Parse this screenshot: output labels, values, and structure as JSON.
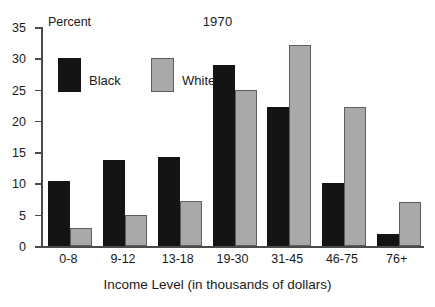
{
  "chart_data": {
    "type": "bar",
    "title": "1970",
    "xlabel": "Income Level (in thousands of dollars)",
    "ylabel": "Percent",
    "ylim": [
      0,
      35
    ],
    "yticks": [
      0,
      5,
      10,
      15,
      20,
      25,
      30,
      35
    ],
    "grid": false,
    "legend_position": "upper-left-inside",
    "categories": [
      "0-8",
      "9-12",
      "13-18",
      "19-30",
      "31-45",
      "46-75",
      "76+"
    ],
    "series": [
      {
        "name": "Black",
        "color": "#141414",
        "values": [
          10.4,
          13.7,
          14.3,
          29.0,
          22.2,
          10.0,
          1.9
        ]
      },
      {
        "name": "White",
        "color": "#a9a9a9",
        "values": [
          2.9,
          5.0,
          7.2,
          25.0,
          32.1,
          22.2,
          7.1
        ]
      }
    ]
  }
}
